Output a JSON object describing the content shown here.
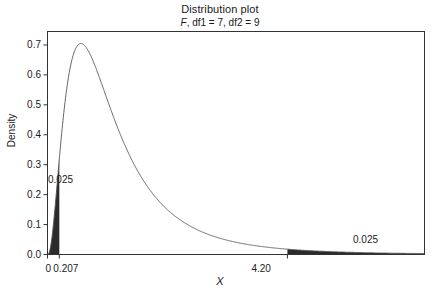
{
  "chart_data": {
    "type": "line",
    "title": "Distribution plot",
    "subtitle_prefix": "F",
    "subtitle_rest": ", df1 = 7, df2 = 9",
    "subtitle": "F, df1 = 7, df2 = 9",
    "distribution": "F",
    "df1": 7,
    "df2": 9,
    "xlabel": "X",
    "ylabel": "Density",
    "xlim": [
      0,
      6.6
    ],
    "ylim": [
      0,
      0.745
    ],
    "grid": false,
    "legend": false,
    "curve_color": "#555555",
    "shade_color": "#2b2b2b",
    "axis_color": "#333333",
    "ytick_labels": [
      "0.0",
      "0.1",
      "0.2",
      "0.3",
      "0.4",
      "0.5",
      "0.6",
      "0.7"
    ],
    "ytick_values": [
      0.0,
      0.1,
      0.2,
      0.3,
      0.4,
      0.5,
      0.6,
      0.7
    ],
    "xtick_labels": [
      "0",
      "0.207",
      "4.20"
    ],
    "xtick_values": [
      0,
      0.207,
      4.2
    ],
    "xtick_overlap_label": "00.207",
    "shaded_regions": [
      {
        "name": "lower-tail",
        "from": 0,
        "to": 0.207,
        "probability": 0.025,
        "label": "0.025"
      },
      {
        "name": "upper-tail",
        "from": 4.2,
        "to": 6.6,
        "probability": 0.025,
        "label": "0.025"
      }
    ],
    "peak": {
      "x": 0.69,
      "y": 0.705
    },
    "x": [
      0.0,
      0.05,
      0.1,
      0.15,
      0.207,
      0.25,
      0.3,
      0.4,
      0.5,
      0.6,
      0.69,
      0.8,
      0.9,
      1.0,
      1.2,
      1.4,
      1.6,
      1.8,
      2.0,
      2.4,
      2.8,
      3.2,
      3.6,
      4.0,
      4.2,
      4.6,
      5.0,
      5.4,
      5.8,
      6.2,
      6.6
    ],
    "y": [
      0.0,
      0.04,
      0.157,
      0.304,
      0.432,
      0.518,
      0.584,
      0.665,
      0.697,
      0.705,
      0.703,
      0.686,
      0.664,
      0.637,
      0.576,
      0.512,
      0.449,
      0.391,
      0.338,
      0.25,
      0.184,
      0.135,
      0.1,
      0.075,
      0.065,
      0.049,
      0.037,
      0.029,
      0.022,
      0.017,
      0.014
    ]
  }
}
